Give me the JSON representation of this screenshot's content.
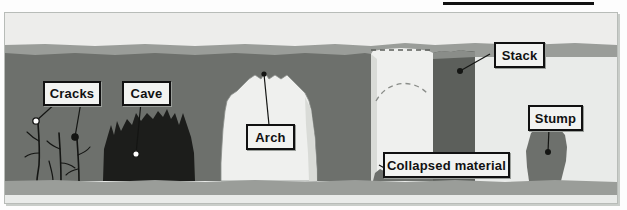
{
  "figure": {
    "title": "",
    "type": "geological cross-section",
    "top_rule_color": "#111111",
    "background_color": "#e9ebe9"
  },
  "palette": {
    "sky": "#ededeb",
    "sea_light": "#9a9d99",
    "rock": "#6d706c",
    "rock_dark": "#5c5f5b",
    "cave_dark": "#1c1d1b",
    "arch_light": "#eff0ee",
    "ground": "#9a9d99",
    "outline": "#111111",
    "label_fill": "#f2f3f1"
  },
  "labels": [
    {
      "id": "cracks",
      "text": "Cracks"
    },
    {
      "id": "cave",
      "text": "Cave"
    },
    {
      "id": "arch",
      "text": "Arch"
    },
    {
      "id": "stack",
      "text": "Stack"
    },
    {
      "id": "stump",
      "text": "Stump"
    },
    {
      "id": "collapsed",
      "text": "Collapsed material"
    }
  ],
  "features": {
    "cracks_description": "thin branching dark lines in cliff face",
    "cave_description": "dark jagged hollow at cliff base",
    "arch_description": "large light opening through headland",
    "stack_description": "isolated rock pillar separated from cliff",
    "stump_description": "short eroded rock remnant on the shore",
    "collapsed_material_description": "rubble heaped on the shore beneath the former arch",
    "former_arch_guide": "dashed outline showing collapsed arch roof"
  }
}
